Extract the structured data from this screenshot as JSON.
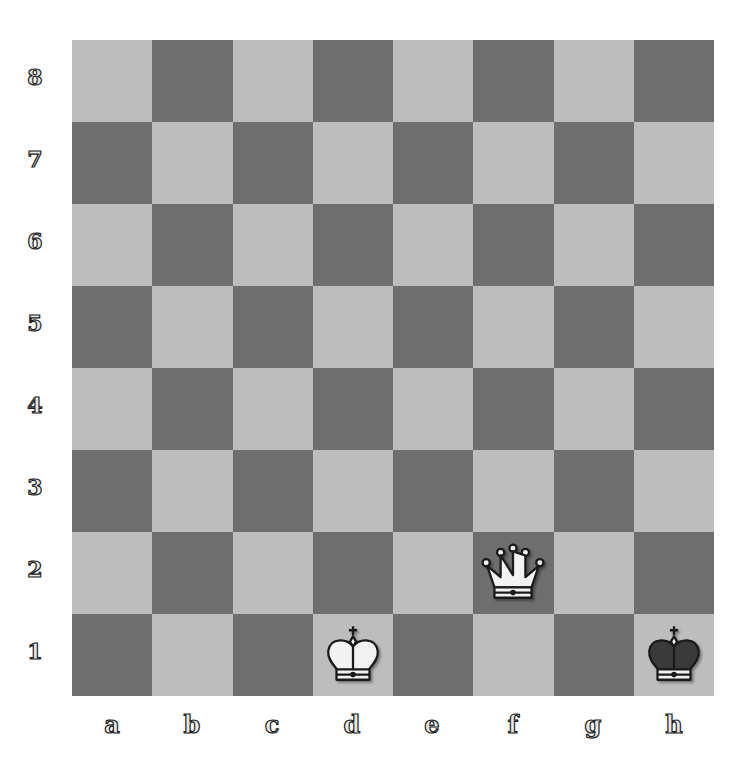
{
  "board": {
    "ranks": [
      "8",
      "7",
      "6",
      "5",
      "4",
      "3",
      "2",
      "1"
    ],
    "files": [
      "a",
      "b",
      "c",
      "d",
      "e",
      "f",
      "g",
      "h"
    ],
    "light_color": "#bdbdbd",
    "dark_color": "#6e6e6e",
    "pieces": [
      {
        "square": "d1",
        "type": "king",
        "color": "white",
        "icon": "white-king-icon"
      },
      {
        "square": "f2",
        "type": "queen",
        "color": "white",
        "icon": "white-queen-icon"
      },
      {
        "square": "h1",
        "type": "king",
        "color": "black",
        "icon": "black-king-icon"
      }
    ]
  },
  "labels": {
    "rank_8": "8",
    "rank_7": "7",
    "rank_6": "6",
    "rank_5": "5",
    "rank_4": "4",
    "rank_3": "3",
    "rank_2": "2",
    "rank_1": "1",
    "file_a": "a",
    "file_b": "b",
    "file_c": "c",
    "file_d": "d",
    "file_e": "e",
    "file_f": "f",
    "file_g": "g",
    "file_h": "h"
  }
}
